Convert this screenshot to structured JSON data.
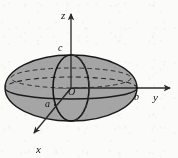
{
  "figure": {
    "kind": "3d-coordinate-diagram",
    "background_color": "#fbfbfa",
    "solid_fill_color": "#a0a0a0",
    "outline_color": "#1a1a1a",
    "axis_color": "#333333"
  },
  "axes": [
    {
      "name": "z-axis",
      "label": "z",
      "direction": "up",
      "label_x": 62,
      "label_y": 17
    },
    {
      "name": "y-axis",
      "label": "y",
      "direction": "right",
      "label_x": 154,
      "label_y": 99
    },
    {
      "name": "x-axis",
      "label": "x",
      "direction": "down-left",
      "label_x": 37,
      "label_y": 151
    }
  ],
  "labels": [
    {
      "name": "origin-label",
      "text": "O",
      "x": 71,
      "y": 94,
      "italic": true
    },
    {
      "name": "semi-axis-a-label",
      "text": "a",
      "x": 46,
      "y": 106,
      "italic": true
    },
    {
      "name": "semi-axis-b-label",
      "text": "b",
      "x": 136,
      "y": 99,
      "italic": true
    },
    {
      "name": "semi-axis-c-label",
      "text": "c",
      "x": 59,
      "y": 50,
      "italic": true
    }
  ],
  "geometry": {
    "origin": {
      "x": 71,
      "y": 88
    },
    "ellipsoid_silhouette": {
      "cx": 71,
      "cy": 88,
      "rx": 66,
      "ry": 33
    },
    "equator_ellipse": {
      "cx": 71,
      "cy": 88,
      "rx": 66,
      "ry": 11,
      "back_half": "dashed",
      "front_half": "solid"
    },
    "upper_latitude_ellipse": {
      "cx": 71,
      "cy": 76,
      "rx": 58,
      "ry": 9,
      "style": "dashed"
    },
    "meridian_ellipse": {
      "cx": 71,
      "cy": 88,
      "rx": 18,
      "ry": 33,
      "style": "solid-with-dashed-back"
    },
    "z_axis_tip": {
      "x": 71,
      "y": 12
    },
    "y_axis_tip": {
      "x": 172,
      "y": 88
    },
    "x_axis_tip": {
      "x": 32,
      "y": 136
    }
  }
}
